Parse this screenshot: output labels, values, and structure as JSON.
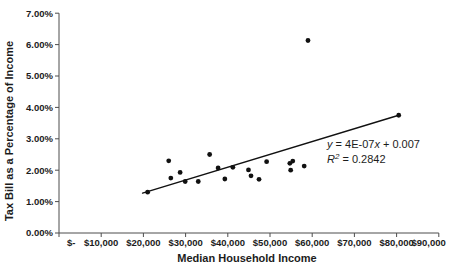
{
  "chart_data": {
    "type": "scatter",
    "title": "",
    "xlabel": "Median Household Income",
    "ylabel": "Tax Bill as a Percentage of Income",
    "x_tick_labels": [
      "$-",
      "$10,000",
      "$20,000",
      "$30,000",
      "$40,000",
      "$50,000",
      "$60,000",
      "$70,000",
      "$80,000",
      "$90,000"
    ],
    "x_tick_values": [
      0,
      10000,
      20000,
      30000,
      40000,
      50000,
      60000,
      70000,
      80000,
      90000
    ],
    "y_tick_labels": [
      "0.00%",
      "1.00%",
      "2.00%",
      "3.00%",
      "4.00%",
      "5.00%",
      "6.00%",
      "7.00%"
    ],
    "y_tick_values": [
      0,
      1,
      2,
      3,
      4,
      5,
      6,
      7
    ],
    "xlim": [
      0,
      90000
    ],
    "ylim": [
      0,
      7
    ],
    "grid": false,
    "legend": "none",
    "points": [
      [
        21000,
        1.3
      ],
      [
        26000,
        2.3
      ],
      [
        26500,
        1.75
      ],
      [
        28700,
        1.93
      ],
      [
        29900,
        1.64
      ],
      [
        33000,
        1.64
      ],
      [
        35700,
        2.5
      ],
      [
        37700,
        2.07
      ],
      [
        39300,
        1.72
      ],
      [
        41200,
        2.09
      ],
      [
        44900,
        2.01
      ],
      [
        45500,
        1.82
      ],
      [
        47400,
        1.71
      ],
      [
        49200,
        2.27
      ],
      [
        54700,
        2.22
      ],
      [
        54900,
        2.0
      ],
      [
        55400,
        2.29
      ],
      [
        58100,
        2.13
      ],
      [
        59000,
        6.13
      ],
      [
        80500,
        3.75
      ]
    ],
    "trendline": {
      "x1": 19800,
      "y1": 1.27,
      "x2": 80500,
      "y2": 3.75,
      "equation_parts": [
        {
          "t": "y",
          "i": 1,
          "sup": 0
        },
        {
          "t": " = 4E-07",
          "i": 0,
          "sup": 0
        },
        {
          "t": "x",
          "i": 1,
          "sup": 0
        },
        {
          "t": " + 0.007",
          "i": 0,
          "sup": 0
        }
      ],
      "r2_parts": [
        {
          "t": "R",
          "i": 1,
          "sup": 0
        },
        {
          "t": "2",
          "i": 1,
          "sup": 1
        },
        {
          "t": " = 0.2842",
          "i": 0,
          "sup": 0
        }
      ]
    },
    "colors": {
      "point": "#111111",
      "trendline": "#111111",
      "axis": "#4d4d4d",
      "text": "#1c1c1c"
    }
  }
}
